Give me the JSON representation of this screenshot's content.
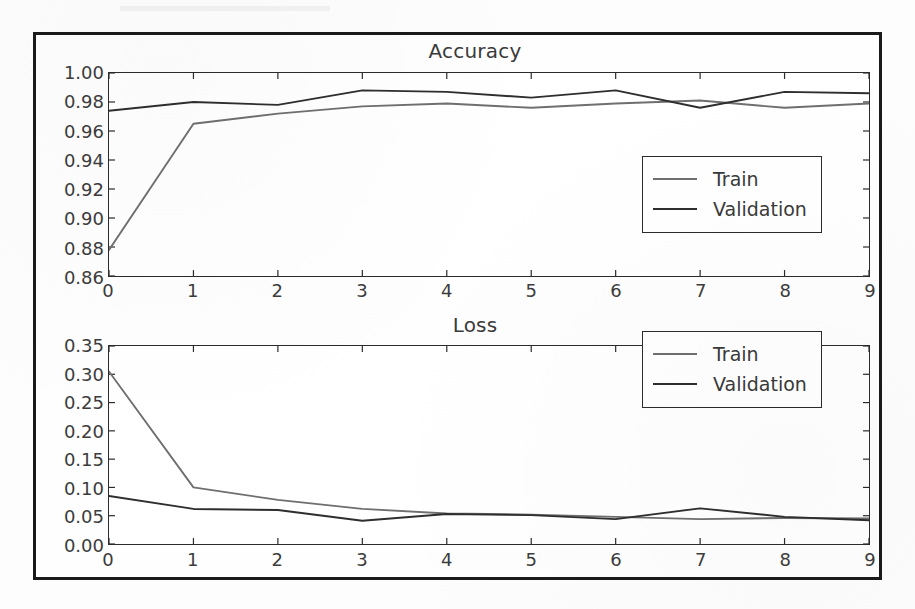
{
  "figure": {
    "background_color": "#fefefe",
    "frame_color": "#1a1a1a"
  },
  "colors": {
    "train_line": "#6f6f6f",
    "validation_line": "#2e2e2e",
    "axis": "#2b2b2b",
    "text": "#3a3a3a"
  },
  "legend": {
    "train_label": "Train",
    "validation_label": "Validation"
  },
  "chart_data": [
    {
      "type": "line",
      "title": "Accuracy",
      "xlabel": "",
      "ylabel": "",
      "x": [
        0,
        1,
        2,
        3,
        4,
        5,
        6,
        7,
        8,
        9
      ],
      "xtick_labels": [
        "0",
        "1",
        "2",
        "3",
        "4",
        "5",
        "6",
        "7",
        "8",
        "9"
      ],
      "ytick_labels": [
        "0.86",
        "0.88",
        "0.90",
        "0.92",
        "0.94",
        "0.96",
        "0.98",
        "1.00"
      ],
      "ytick_values": [
        0.86,
        0.88,
        0.9,
        0.92,
        0.94,
        0.96,
        0.98,
        1.0
      ],
      "xlim": [
        0,
        9
      ],
      "ylim": [
        0.86,
        1.0
      ],
      "grid": false,
      "legend_position": "lower right",
      "series": [
        {
          "name": "Train",
          "color": "#6f6f6f",
          "values": [
            0.878,
            0.965,
            0.972,
            0.977,
            0.979,
            0.976,
            0.979,
            0.981,
            0.976,
            0.979
          ]
        },
        {
          "name": "Validation",
          "color": "#2e2e2e",
          "values": [
            0.974,
            0.98,
            0.978,
            0.988,
            0.987,
            0.983,
            0.988,
            0.976,
            0.987,
            0.986
          ]
        }
      ]
    },
    {
      "type": "line",
      "title": "Loss",
      "xlabel": "",
      "ylabel": "",
      "x": [
        0,
        1,
        2,
        3,
        4,
        5,
        6,
        7,
        8,
        9
      ],
      "xtick_labels": [
        "0",
        "1",
        "2",
        "3",
        "4",
        "5",
        "6",
        "7",
        "8",
        "9"
      ],
      "ytick_labels": [
        "0.00",
        "0.05",
        "0.10",
        "0.15",
        "0.20",
        "0.25",
        "0.30",
        "0.35"
      ],
      "ytick_values": [
        0.0,
        0.05,
        0.1,
        0.15,
        0.2,
        0.25,
        0.3,
        0.35
      ],
      "xlim": [
        0,
        9
      ],
      "ylim": [
        0.0,
        0.35
      ],
      "grid": false,
      "legend_position": "upper right",
      "series": [
        {
          "name": "Train",
          "color": "#6f6f6f",
          "values": [
            0.305,
            0.1,
            0.078,
            0.062,
            0.054,
            0.052,
            0.048,
            0.044,
            0.046,
            0.045
          ]
        },
        {
          "name": "Validation",
          "color": "#2e2e2e",
          "values": [
            0.085,
            0.062,
            0.06,
            0.041,
            0.053,
            0.051,
            0.044,
            0.063,
            0.048,
            0.042
          ]
        }
      ]
    }
  ]
}
